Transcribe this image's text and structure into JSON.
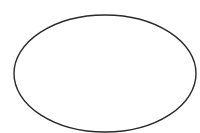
{
  "canvas": {
    "width": 200,
    "height": 133,
    "background": "#ffffff"
  },
  "shapes": [
    {
      "type": "ellipse",
      "cx": 105,
      "cy": 73.5,
      "rx": 91,
      "ry": 58.5,
      "stroke": "#2a2a2a",
      "stroke_width": 1.4,
      "fill": "#ffffff"
    }
  ]
}
